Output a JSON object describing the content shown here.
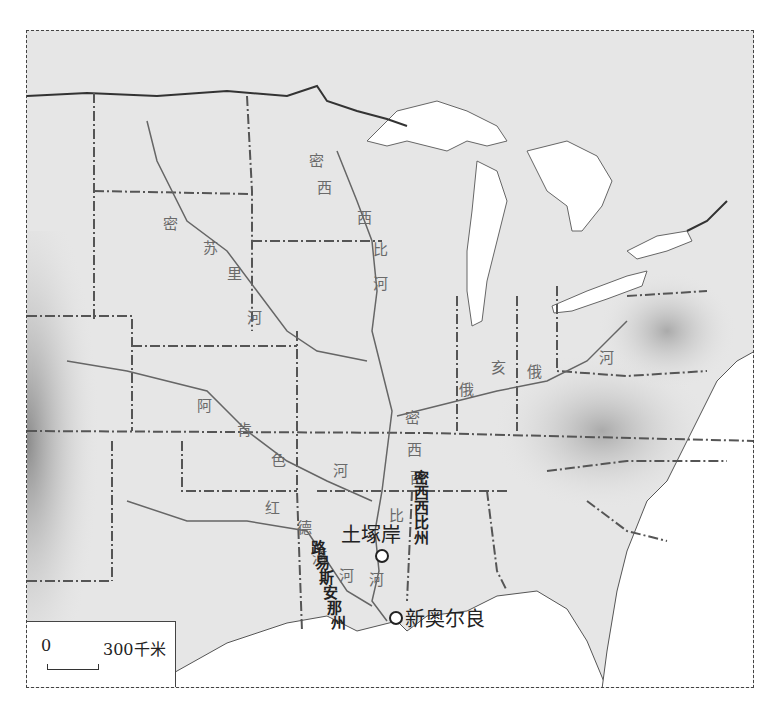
{
  "map": {
    "title": "Mississippi River basin relief map",
    "colors": {
      "land": "#e6e6e6",
      "water": "#ffffff",
      "relief_dark": "#9a9a9a",
      "river": "#555555",
      "border": "#444444"
    }
  },
  "rivers": {
    "missouri": [
      "密",
      "苏",
      "里",
      "河"
    ],
    "mississippi_upper": [
      "密",
      "西",
      "西",
      "比",
      "河"
    ],
    "mississippi_lower": [
      "密",
      "西",
      "西",
      "比",
      "河"
    ],
    "arkansas": [
      "阿",
      "肯",
      "色",
      "河"
    ],
    "red": [
      "红",
      "河"
    ],
    "ohio": [
      "俄",
      "亥",
      "俄",
      "河"
    ],
    "red_lower": [
      "德",
      "河"
    ]
  },
  "states": {
    "mississippi": [
      "密",
      "西",
      "西",
      "比",
      "州"
    ],
    "louisiana": [
      "路",
      "易",
      "斯",
      "安",
      "那",
      "州"
    ]
  },
  "cities": [
    {
      "name": "土塚岸",
      "type": "city"
    },
    {
      "name": "新奥尔良",
      "type": "city"
    }
  ],
  "scale": {
    "zero": "0",
    "max": "300千米"
  },
  "caption": ""
}
